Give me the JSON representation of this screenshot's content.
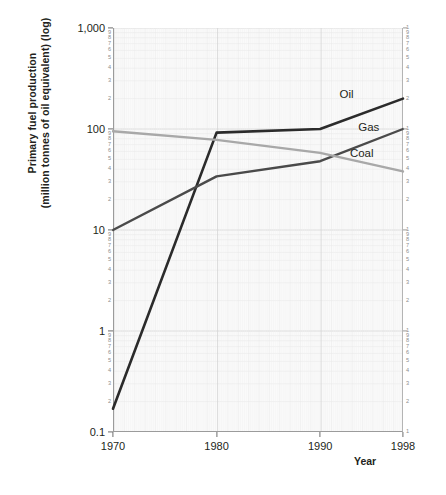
{
  "axes": {
    "y_title_line1": "Primary fuel production",
    "y_title_line2": "(million tonnes of oil equivalent) (log)",
    "x_title": "Year",
    "y_decades": [
      "1,000",
      "100",
      "10",
      "1",
      "0.1"
    ],
    "y_minor": [
      "9",
      "8",
      "7",
      "6",
      "5",
      "4",
      "3",
      "2"
    ],
    "x_ticks": [
      "1970",
      "1980",
      "1990",
      "1998"
    ]
  },
  "series_labels": {
    "oil": "Oil",
    "gas": "Gas",
    "coal": "Coal"
  },
  "colors": {
    "oil": "#2b2b2b",
    "gas": "#4a4a4a",
    "coal": "#a8a8a8",
    "grid_minor": "#e9e9e9",
    "grid_major": "#d8d8d8",
    "plot_bg": "#fafafa",
    "text": "#231f20",
    "tick_text": "#8d8d8d"
  },
  "chart_data": {
    "type": "line",
    "title": "",
    "xlabel": "Year",
    "ylabel": "Primary fuel production (million tonnes of oil equivalent) (log)",
    "yscale": "log",
    "ylim": [
      0.1,
      1000
    ],
    "xlim": [
      1970,
      1998
    ],
    "grid": true,
    "legend": "inline-labels-right",
    "x": [
      1970,
      1980,
      1990,
      1998
    ],
    "series": [
      {
        "name": "Oil",
        "values": [
          0.17,
          92,
          100,
          200
        ]
      },
      {
        "name": "Gas",
        "values": [
          10,
          34,
          48,
          100
        ]
      },
      {
        "name": "Coal",
        "values": [
          95,
          78,
          58,
          38
        ]
      }
    ]
  }
}
